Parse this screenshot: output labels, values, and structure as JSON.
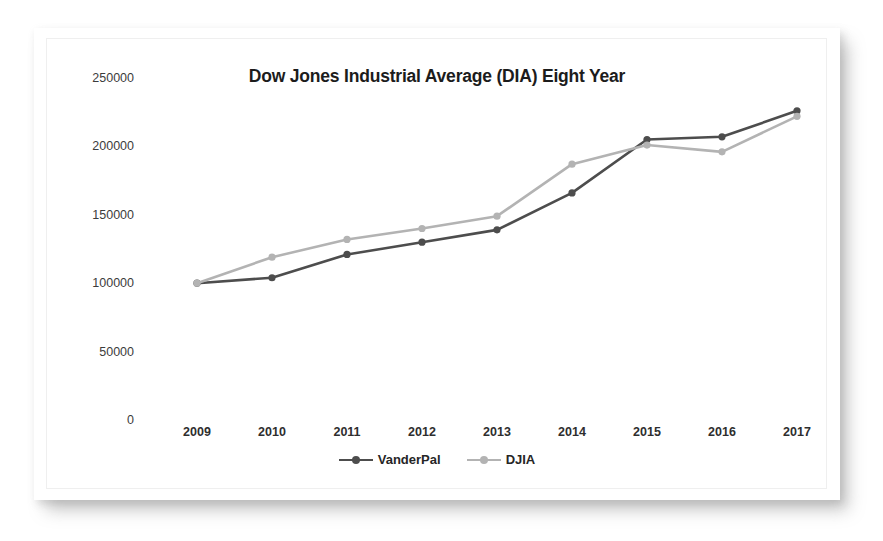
{
  "card": {
    "background_color": "#ffffff",
    "frame_color": "#efefef"
  },
  "legend": {
    "position": "bottom",
    "entries": [
      {
        "label": "VanderPal",
        "color": "#4d4d4d"
      },
      {
        "label": "DJIA",
        "color": "#b3b3b3"
      }
    ]
  },
  "chart_data": {
    "type": "line",
    "title": "Dow Jones Industrial Average (DIA) Eight Year",
    "xlabel": "",
    "ylabel": "",
    "categories": [
      "2009",
      "2010",
      "2011",
      "2012",
      "2013",
      "2014",
      "2015",
      "2016",
      "2017"
    ],
    "x": [
      2009,
      2010,
      2011,
      2012,
      2013,
      2014,
      2015,
      2016,
      2017
    ],
    "ylim": [
      0,
      250000
    ],
    "ytick_labels": [
      "0",
      "50000",
      "100000",
      "150000",
      "200000",
      "250000"
    ],
    "yticks": [
      0,
      50000,
      100000,
      150000,
      200000,
      250000
    ],
    "grid": false,
    "legend_position": "bottom",
    "series": [
      {
        "name": "VanderPal",
        "color": "#4d4d4d",
        "marker": "circle",
        "values": [
          100000,
          104000,
          121000,
          130000,
          139000,
          166000,
          205000,
          207000,
          226000
        ]
      },
      {
        "name": "DJIA",
        "color": "#b3b3b3",
        "marker": "circle",
        "values": [
          100000,
          119000,
          132000,
          140000,
          149000,
          187000,
          201000,
          196000,
          222000
        ]
      }
    ]
  }
}
